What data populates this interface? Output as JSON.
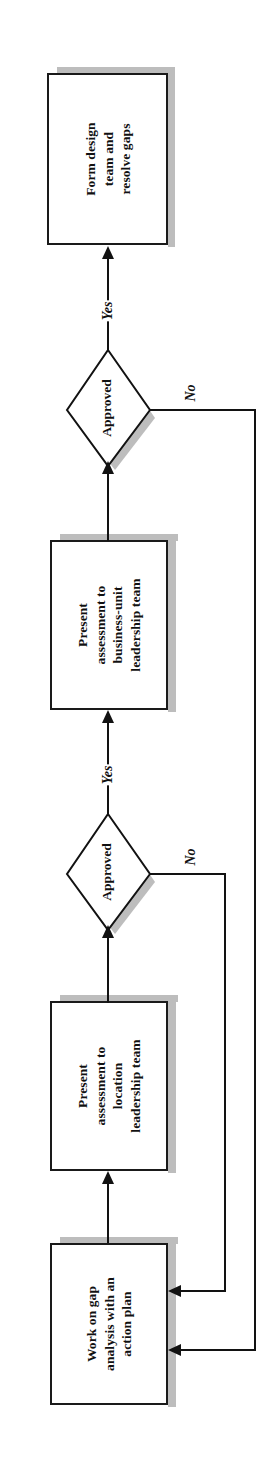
{
  "diagram": {
    "orientation": "rotated-90-counterclockwise",
    "colors": {
      "stroke": "#121212",
      "fill": "#ffffff",
      "shadow": "#bdbdbd",
      "text": "#111111"
    },
    "nodes": [
      {
        "id": "form-design-team",
        "type": "process",
        "text": "Form design\nteam and\nresolve gaps",
        "line1": "Form design",
        "line2": "team and",
        "line3": "resolve gaps"
      },
      {
        "id": "approved-business-unit",
        "type": "decision",
        "text": "Approved"
      },
      {
        "id": "present-business-unit",
        "type": "process",
        "text": "Present\nassessment to\nbusiness-unit\nleadership team",
        "line1": "Present",
        "line2": "assessment to",
        "line3": "business-unit",
        "line4": "leadership team"
      },
      {
        "id": "approved-location",
        "type": "decision",
        "text": "Approved"
      },
      {
        "id": "present-location",
        "type": "process",
        "text": "Present\nassessment to\nlocation\nleadership team",
        "line1": "Present",
        "line2": "assessment to",
        "line3": "location",
        "line4": "leadership team"
      },
      {
        "id": "gap-analysis",
        "type": "process",
        "text": "Work on gap\nanalysis with an\naction plan",
        "line1": "Work on gap",
        "line2": "analysis with an",
        "line3": "action plan"
      }
    ],
    "edge_labels": {
      "yes_top": "Yes",
      "no_top": "No",
      "yes_mid": "Yes",
      "no_mid": "No"
    }
  }
}
